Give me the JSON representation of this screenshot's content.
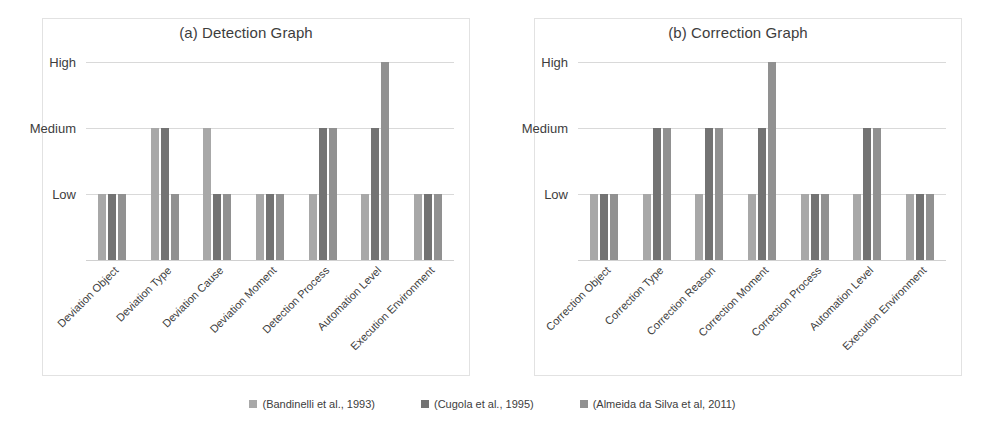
{
  "legend": {
    "position": "bottom-center",
    "items": [
      {
        "label": "(Bandinelli et al., 1993)",
        "color": "#a8a8a8"
      },
      {
        "label": "(Cugola et al., 1995)",
        "color": "#737373"
      },
      {
        "label": "(Almeida da Silva et al, 2011)",
        "color": "#919191"
      }
    ]
  },
  "chart_data": [
    {
      "type": "bar",
      "title": "(a) Detection Graph",
      "xlabel": "",
      "ylabel": "",
      "grid": true,
      "ytick_labels": [
        "Low",
        "Medium",
        "High"
      ],
      "ytick_values": [
        1,
        2,
        3
      ],
      "ylim": [
        0,
        3
      ],
      "categories": [
        "Deviation Object",
        "Deviation Type",
        "Deviation Cause",
        "Deviation Moment",
        "Detection Process",
        "Automation Level",
        "Execution Environment"
      ],
      "series": [
        {
          "name": "(Bandinelli et al., 1993)",
          "color": "#a8a8a8",
          "values": [
            1,
            2,
            2,
            1,
            1,
            1,
            1
          ]
        },
        {
          "name": "(Cugola et al., 1995)",
          "color": "#737373",
          "values": [
            1,
            2,
            1,
            1,
            2,
            2,
            1
          ]
        },
        {
          "name": "(Almeida da Silva et al, 2011)",
          "color": "#919191",
          "values": [
            1,
            1,
            1,
            1,
            2,
            3,
            1
          ]
        }
      ]
    },
    {
      "type": "bar",
      "title": "(b) Correction Graph",
      "xlabel": "",
      "ylabel": "",
      "grid": true,
      "ytick_labels": [
        "Low",
        "Medium",
        "High"
      ],
      "ytick_values": [
        1,
        2,
        3
      ],
      "ylim": [
        0,
        3
      ],
      "categories": [
        "Correction Object",
        "Correction Type",
        "Correction Reason",
        "Correction Moment",
        "Correction Process",
        "Automation Level",
        "Execution Environment"
      ],
      "series": [
        {
          "name": "(Bandinelli et al., 1993)",
          "color": "#a8a8a8",
          "values": [
            1,
            1,
            1,
            1,
            1,
            1,
            1
          ]
        },
        {
          "name": "(Cugola et al., 1995)",
          "color": "#737373",
          "values": [
            1,
            2,
            2,
            2,
            1,
            2,
            1
          ]
        },
        {
          "name": "(Almeida da Silva et al, 2011)",
          "color": "#919191",
          "values": [
            1,
            2,
            2,
            3,
            1,
            2,
            1
          ]
        }
      ]
    }
  ]
}
